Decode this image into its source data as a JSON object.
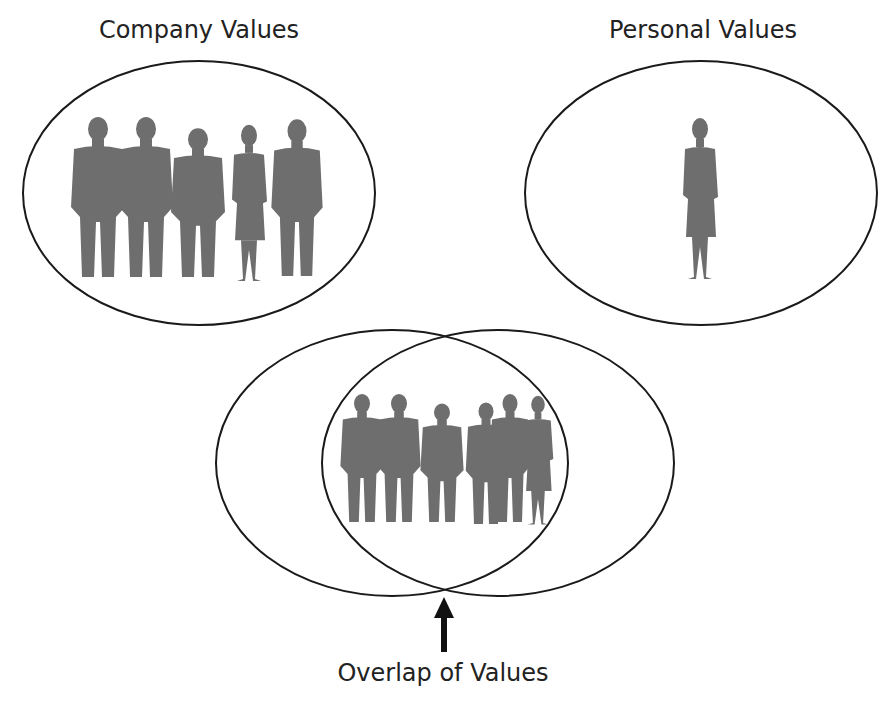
{
  "diagram": {
    "company": {
      "label": "Company Values",
      "people_count": 5
    },
    "personal": {
      "label": "Personal Values",
      "people_count": 1
    },
    "overlap": {
      "label": "Overlap of Values",
      "people_count": 6
    }
  },
  "colors": {
    "outline": "#1a1a1a",
    "silhouette": "#6e6e6e",
    "background": "#ffffff"
  }
}
